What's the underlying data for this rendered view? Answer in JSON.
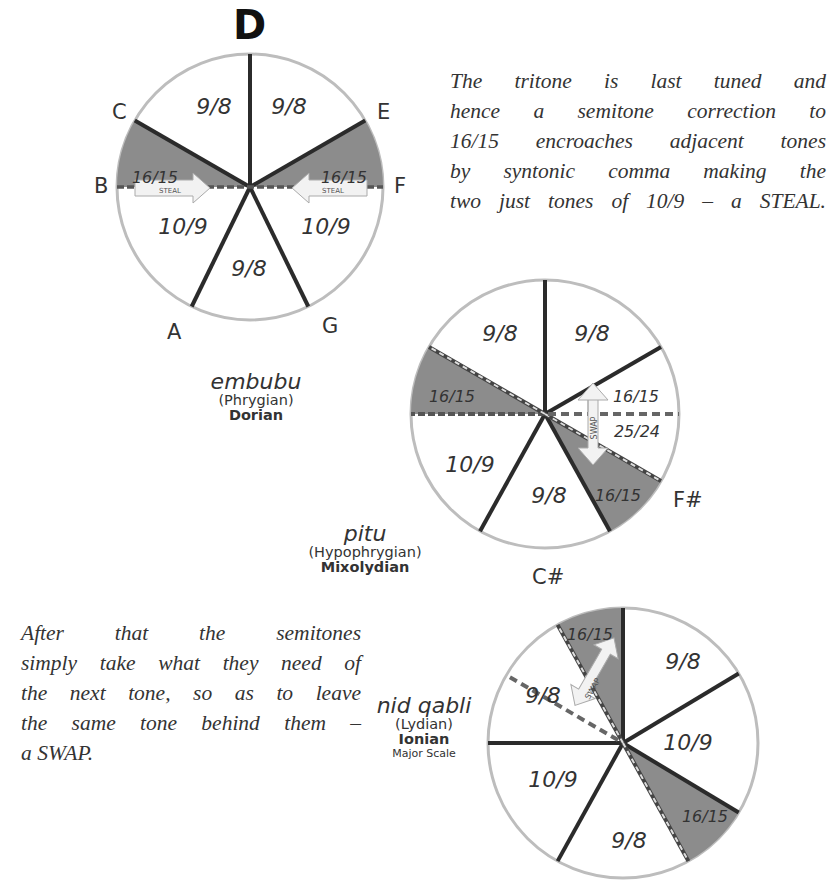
{
  "wheel1": {
    "title": "D",
    "notes": {
      "C": "C",
      "E": "E",
      "B": "B",
      "F": "F",
      "A": "A",
      "G": "G"
    },
    "ratios": {
      "top_left": "9/8",
      "top_right": "9/8",
      "left_semitone": "16/15",
      "right_semitone": "16/15",
      "lower_left": "10/9",
      "lower_right": "10/9",
      "bottom": "9/8"
    },
    "arrows": {
      "left": "STEAL",
      "right": "STEAL"
    },
    "mode": {
      "native": "embubu",
      "paren": "(Phrygian)",
      "greek": "Dorian"
    }
  },
  "wheel2": {
    "notes": {
      "Fsharp": "F#"
    },
    "ratios": {
      "top_left": "9/8",
      "top_right": "9/8",
      "left_semitone": "16/15",
      "right_upper": "16/15",
      "right_lower": "25/24",
      "lower_left": "10/9",
      "bottom": "9/8",
      "lower_right_semitone": "16/15"
    },
    "arrows": {
      "swap": "SWAP"
    },
    "mode": {
      "native": "pitu",
      "paren": "(Hypophrygian)",
      "greek": "Mixolydian"
    }
  },
  "wheel3": {
    "notes": {
      "Csharp": "C#"
    },
    "ratios": {
      "top_semitone": "16/15",
      "top_right": "9/8",
      "right": "10/9",
      "upper_left": "9/8",
      "lower_left": "10/9",
      "bottom": "9/8",
      "lower_right_semitone": "16/15"
    },
    "arrows": {
      "swap": "SWAP"
    },
    "mode": {
      "native": "nid qabli",
      "paren": "(Lydian)",
      "greek": "Ionian",
      "sub": "Major Scale"
    }
  },
  "text": {
    "steal_paragraph": [
      "The tritone is last tuned and",
      "hence a semitone correction to",
      "16/15 encroaches adjacent tones",
      "by syntonic comma making the",
      "two just tones of 10/9 – a STEAL."
    ],
    "swap_paragraph": [
      "After that the semitones",
      "simply take what they need of",
      "the next tone, so as to leave",
      "the same tone behind them –",
      "a SWAP."
    ]
  },
  "colors": {
    "semitone_fill": "#8c8c8c",
    "rim": "#b8b8b8",
    "spoke": "#2b2b2b",
    "text": "#333333"
  }
}
